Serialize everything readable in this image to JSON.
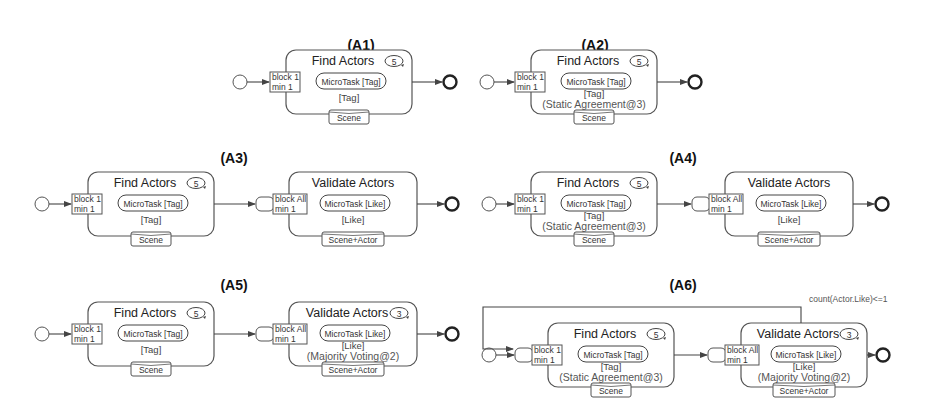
{
  "diagrams": [
    {
      "id": "A1",
      "title": "(A1)",
      "tasks": [
        {
          "name": "Find Actors",
          "repeat": "5",
          "block": "block 1",
          "min": "min   1",
          "microtask": "MicroTask [Tag]",
          "output": "[Tag]",
          "aggregation": "",
          "input": "Scene",
          "queue": false
        }
      ],
      "loop_condition": ""
    },
    {
      "id": "A2",
      "title": "(A2)",
      "tasks": [
        {
          "name": "Find Actors",
          "repeat": "5",
          "block": "block 1",
          "min": "min   1",
          "microtask": "MicroTask [Tag]",
          "output": "[Tag]",
          "aggregation": "(Static Agreement@3)",
          "input": "Scene",
          "queue": false
        }
      ],
      "loop_condition": ""
    },
    {
      "id": "A3",
      "title": "(A3)",
      "tasks": [
        {
          "name": "Find Actors",
          "repeat": "5",
          "block": "block 1",
          "min": "min   1",
          "microtask": "MicroTask [Tag]",
          "output": "[Tag]",
          "aggregation": "",
          "input": "Scene",
          "queue": false
        },
        {
          "name": "Validate Actors",
          "repeat": "",
          "block": "block All",
          "min": "min   1",
          "microtask": "MicroTask [Like]",
          "output": "[Like]",
          "aggregation": "",
          "input": "Scene+Actor",
          "queue": true
        }
      ],
      "loop_condition": ""
    },
    {
      "id": "A4",
      "title": "(A4)",
      "tasks": [
        {
          "name": "Find Actors",
          "repeat": "5",
          "block": "block 1",
          "min": "min   1",
          "microtask": "MicroTask [Tag]",
          "output": "[Tag]",
          "aggregation": "(Static Agreement@3)",
          "input": "Scene",
          "queue": false
        },
        {
          "name": "Validate Actors",
          "repeat": "",
          "block": "block All",
          "min": "min   1",
          "microtask": "MicroTask [Like]",
          "output": "[Like]",
          "aggregation": "",
          "input": "Scene+Actor",
          "queue": true
        }
      ],
      "loop_condition": ""
    },
    {
      "id": "A5",
      "title": "(A5)",
      "tasks": [
        {
          "name": "Find Actors",
          "repeat": "5",
          "block": "block 1",
          "min": "min   1",
          "microtask": "MicroTask [Tag]",
          "output": "[Tag]",
          "aggregation": "",
          "input": "Scene",
          "queue": false
        },
        {
          "name": "Validate Actors",
          "repeat": "3",
          "block": "block All",
          "min": "min   1",
          "microtask": "MicroTask [Like]",
          "output": "[Like]",
          "aggregation": "(Majority Voting@2)",
          "input": "Scene+Actor",
          "queue": true
        }
      ],
      "loop_condition": ""
    },
    {
      "id": "A6",
      "title": "(A6)",
      "tasks": [
        {
          "name": "Find Actors",
          "repeat": "5",
          "block": "block 1",
          "min": "min   1",
          "microtask": "MicroTask [Tag]",
          "output": "[Tag]",
          "aggregation": "(Static Agreement@3)",
          "input": "Scene",
          "queue": true
        },
        {
          "name": "Validate Actors",
          "repeat": "3",
          "block": "block All",
          "min": "min   1",
          "microtask": "MicroTask [Like]",
          "output": "[Like]",
          "aggregation": "(Majority Voting@2)",
          "input": "Scene+Actor",
          "queue": true
        }
      ],
      "loop_condition": "count(Actor.Like)<=1"
    }
  ]
}
